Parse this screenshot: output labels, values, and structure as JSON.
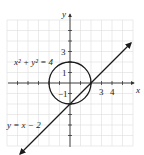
{
  "chart_data": {
    "type": "line",
    "title": "",
    "xlabel": "x",
    "ylabel": "y",
    "xlim": [
      -6,
      6
    ],
    "ylim": [
      -6,
      6
    ],
    "grid": true,
    "x_tick_labels": [
      "3",
      "4"
    ],
    "y_tick_labels": [
      "3",
      "1",
      "-1"
    ],
    "series": [
      {
        "name": "x^2 + y^2 = 4",
        "kind": "circle",
        "center": [
          0,
          0
        ],
        "radius": 2
      },
      {
        "name": "y = x - 2",
        "kind": "line",
        "slope": 1,
        "intercept": -2,
        "x_range": [
          -4.8,
          5.7
        ],
        "arrows": "both"
      }
    ],
    "annotations": [
      {
        "text_base": "x",
        "sup1": "2",
        "plus": " + ",
        "text_base2": "y",
        "sup2": "2",
        "eq": " = 4",
        "label": "x^2 + y^2 = 4"
      },
      {
        "label": "y = x − 2"
      }
    ],
    "intersections": [
      [
        0,
        -2
      ],
      [
        2,
        0
      ]
    ]
  },
  "labels": {
    "x_axis": "x",
    "y_axis": "y",
    "circle_eq": "x² + y² = 4",
    "line_eq": "y = x − 2",
    "tick_x_3": "3",
    "tick_x_4": "4",
    "tick_y_3": "3",
    "tick_y_1": "1",
    "tick_y_m1": "−1"
  },
  "colors": {
    "grid": "#d9d9d9",
    "axis": "#333333",
    "curve": "#1a1a1a"
  }
}
